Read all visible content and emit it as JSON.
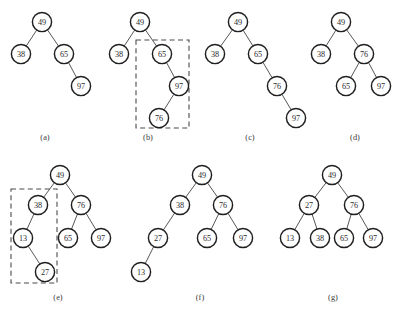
{
  "figure": {
    "width": 401,
    "height": 312,
    "background_color": "#ffffff",
    "node_stroke_color": "#1f1f1f",
    "node_fill_color": "#ffffff",
    "edge_color": "#575757",
    "highlight_box_color": "#4a4a4a",
    "text_color": "#2b2b2b",
    "node_radius": 9.6
  },
  "panels": [
    {
      "id": "a",
      "caption": "(a)",
      "caption_x": 45,
      "caption_y": 137,
      "nodes": [
        {
          "label": "49",
          "x": 42,
          "y": 22
        },
        {
          "label": "38",
          "x": 21,
          "y": 54
        },
        {
          "label": "65",
          "x": 64,
          "y": 54
        },
        {
          "label": "97",
          "x": 81,
          "y": 86
        }
      ],
      "edges": [
        {
          "from": "49",
          "to": "38"
        },
        {
          "from": "49",
          "to": "65"
        },
        {
          "from": "65",
          "to": "97"
        }
      ],
      "highlight_box": null
    },
    {
      "id": "b",
      "caption": "(b)",
      "caption_x": 148,
      "caption_y": 137,
      "nodes": [
        {
          "label": "49",
          "x": 140,
          "y": 22
        },
        {
          "label": "38",
          "x": 119,
          "y": 54
        },
        {
          "label": "65",
          "x": 162,
          "y": 54
        },
        {
          "label": "97",
          "x": 179,
          "y": 86
        },
        {
          "label": "76",
          "x": 159,
          "y": 118
        }
      ],
      "edges": [
        {
          "from": "49",
          "to": "38"
        },
        {
          "from": "49",
          "to": "65"
        },
        {
          "from": "65",
          "to": "97"
        },
        {
          "from": "97",
          "to": "76"
        }
      ],
      "highlight_box": {
        "x": 136,
        "y": 40,
        "width": 53,
        "height": 88
      }
    },
    {
      "id": "c",
      "caption": "(c)",
      "caption_x": 250,
      "caption_y": 137,
      "nodes": [
        {
          "label": "49",
          "x": 238,
          "y": 22
        },
        {
          "label": "38",
          "x": 215,
          "y": 54
        },
        {
          "label": "65",
          "x": 258,
          "y": 54
        },
        {
          "label": "76",
          "x": 277,
          "y": 86
        },
        {
          "label": "97",
          "x": 296,
          "y": 118
        }
      ],
      "edges": [
        {
          "from": "49",
          "to": "38"
        },
        {
          "from": "49",
          "to": "65"
        },
        {
          "from": "65",
          "to": "76"
        },
        {
          "from": "76",
          "to": "97"
        }
      ],
      "highlight_box": null
    },
    {
      "id": "d",
      "caption": "(d)",
      "caption_x": 355,
      "caption_y": 137,
      "nodes": [
        {
          "label": "49",
          "x": 341,
          "y": 22
        },
        {
          "label": "38",
          "x": 321,
          "y": 54
        },
        {
          "label": "76",
          "x": 364,
          "y": 54
        },
        {
          "label": "65",
          "x": 346,
          "y": 86
        },
        {
          "label": "97",
          "x": 381,
          "y": 86
        }
      ],
      "edges": [
        {
          "from": "49",
          "to": "38"
        },
        {
          "from": "49",
          "to": "76"
        },
        {
          "from": "76",
          "to": "65"
        },
        {
          "from": "76",
          "to": "97"
        }
      ],
      "highlight_box": null
    },
    {
      "id": "e",
      "caption": "(e)",
      "caption_x": 58,
      "caption_y": 297,
      "nodes": [
        {
          "label": "49",
          "x": 60,
          "y": 175
        },
        {
          "label": "38",
          "x": 38,
          "y": 205
        },
        {
          "label": "76",
          "x": 81,
          "y": 205
        },
        {
          "label": "13",
          "x": 23,
          "y": 238
        },
        {
          "label": "65",
          "x": 68,
          "y": 238
        },
        {
          "label": "97",
          "x": 101,
          "y": 238
        },
        {
          "label": "27",
          "x": 45,
          "y": 272
        }
      ],
      "edges": [
        {
          "from": "49",
          "to": "38"
        },
        {
          "from": "49",
          "to": "76"
        },
        {
          "from": "38",
          "to": "13"
        },
        {
          "from": "76",
          "to": "65"
        },
        {
          "from": "76",
          "to": "97"
        },
        {
          "from": "13",
          "to": "27"
        }
      ],
      "highlight_box": {
        "x": 11,
        "y": 189,
        "width": 46,
        "height": 94
      }
    },
    {
      "id": "f",
      "caption": "(f)",
      "caption_x": 200,
      "caption_y": 297,
      "nodes": [
        {
          "label": "49",
          "x": 202,
          "y": 175
        },
        {
          "label": "38",
          "x": 180,
          "y": 205
        },
        {
          "label": "76",
          "x": 223,
          "y": 205
        },
        {
          "label": "27",
          "x": 158,
          "y": 238
        },
        {
          "label": "65",
          "x": 207,
          "y": 238
        },
        {
          "label": "97",
          "x": 243,
          "y": 238
        },
        {
          "label": "13",
          "x": 141,
          "y": 272
        }
      ],
      "edges": [
        {
          "from": "49",
          "to": "38"
        },
        {
          "from": "49",
          "to": "76"
        },
        {
          "from": "38",
          "to": "27"
        },
        {
          "from": "76",
          "to": "65"
        },
        {
          "from": "76",
          "to": "97"
        },
        {
          "from": "27",
          "to": "13"
        }
      ],
      "highlight_box": null
    },
    {
      "id": "g",
      "caption": "(g)",
      "caption_x": 333,
      "caption_y": 297,
      "nodes": [
        {
          "label": "49",
          "x": 332,
          "y": 175
        },
        {
          "label": "27",
          "x": 309,
          "y": 205
        },
        {
          "label": "76",
          "x": 354,
          "y": 205
        },
        {
          "label": "13",
          "x": 290,
          "y": 238
        },
        {
          "label": "38",
          "x": 320,
          "y": 238
        },
        {
          "label": "65",
          "x": 344,
          "y": 238
        },
        {
          "label": "97",
          "x": 373,
          "y": 238
        }
      ],
      "edges": [
        {
          "from": "49",
          "to": "27"
        },
        {
          "from": "49",
          "to": "76"
        },
        {
          "from": "27",
          "to": "13"
        },
        {
          "from": "27",
          "to": "38"
        },
        {
          "from": "76",
          "to": "65"
        },
        {
          "from": "76",
          "to": "97"
        }
      ],
      "highlight_box": null
    }
  ]
}
